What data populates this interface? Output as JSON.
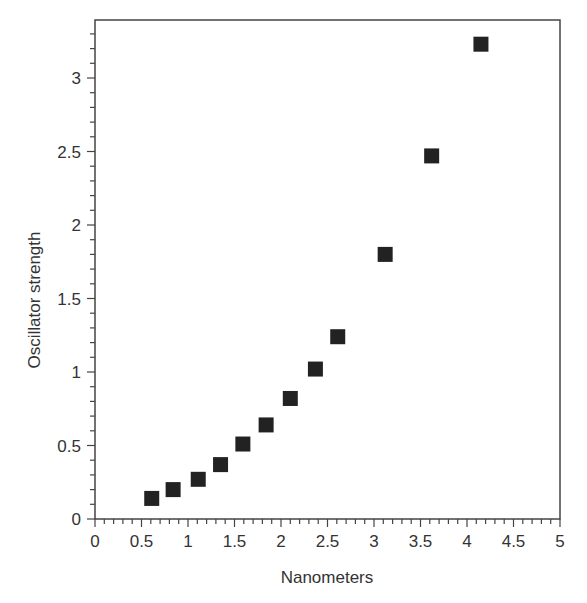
{
  "chart_data": {
    "type": "scatter",
    "title": "",
    "xlabel": "Nanometers",
    "ylabel": "Oscillator strength",
    "xlim": [
      0,
      5
    ],
    "ylim": [
      0,
      3.35
    ],
    "x_ticks": [
      "0",
      "0.5",
      "1",
      "1.5",
      "2",
      "2.5",
      "3",
      "3.5",
      "4",
      "4.5",
      "5"
    ],
    "y_ticks": [
      "0",
      "0.5",
      "1",
      "1.5",
      "2",
      "2.5",
      "3"
    ],
    "grid": false,
    "legend": null,
    "marker": "filled-square",
    "marker_color": "#222222",
    "series": [
      {
        "name": "Oscillator strength",
        "x": [
          0.61,
          0.84,
          1.11,
          1.35,
          1.59,
          1.84,
          2.1,
          2.37,
          2.61,
          3.12,
          3.62,
          4.15
        ],
        "y": [
          0.14,
          0.2,
          0.27,
          0.37,
          0.51,
          0.64,
          0.82,
          1.02,
          1.24,
          1.8,
          2.47,
          3.23
        ]
      }
    ]
  }
}
